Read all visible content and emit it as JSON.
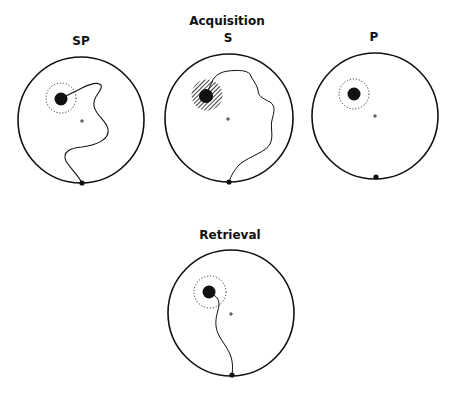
{
  "figure": {
    "sections": {
      "acquisition": {
        "title": "Acquisition"
      },
      "retrieval": {
        "title": "Retrieval"
      }
    },
    "panels": [
      {
        "id": "sp",
        "label": "SP",
        "goal_marker": "dotted-ring",
        "path_present": true
      },
      {
        "id": "s",
        "label": "S",
        "goal_marker": "hatched-disc",
        "path_present": true
      },
      {
        "id": "p",
        "label": "P",
        "goal_marker": "dotted-ring",
        "path_present": false
      },
      {
        "id": "retrieval",
        "label": "",
        "goal_marker": "dotted-ring",
        "path_present": true
      }
    ],
    "colors": {
      "ink": "#111111",
      "background": "#ffffff"
    }
  }
}
